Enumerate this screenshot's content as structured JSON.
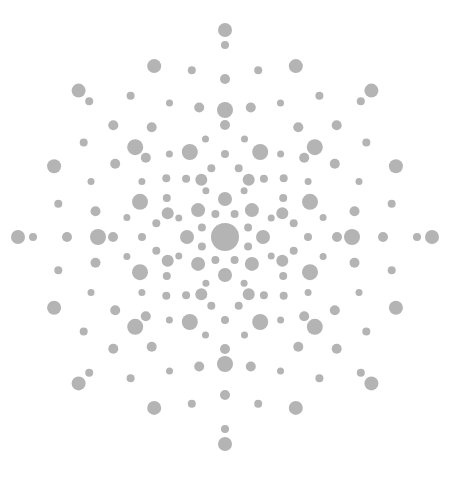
{
  "pattern": {
    "background": "#ffffff",
    "dot_color": "#b4b4b4",
    "center": [
      225,
      237
    ],
    "center_radius": 14,
    "rings": [
      {
        "r": 25,
        "count": 8,
        "size": 4,
        "offset": 22.5
      },
      {
        "r": 38,
        "count": 8,
        "size": 7,
        "offset": 0
      },
      {
        "r": 50,
        "count": 8,
        "size": 3.5,
        "offset": 22.5
      },
      {
        "r": 62,
        "count": 8,
        "size": 6,
        "offset": 22.5
      },
      {
        "r": 70,
        "count": 16,
        "size": 4,
        "offset": 11.25
      },
      {
        "r": 83,
        "count": 8,
        "size": 4,
        "offset": 0
      },
      {
        "r": 92,
        "count": 8,
        "size": 8,
        "offset": 22.5
      },
      {
        "r": 100,
        "count": 16,
        "size": 3.5,
        "offset": 11.25
      },
      {
        "r": 112,
        "count": 8,
        "size": 5,
        "offset": 0
      },
      {
        "r": 127,
        "count": 8,
        "size": 8,
        "offset": 0
      },
      {
        "r": 132,
        "count": 16,
        "size": 5,
        "offset": 11.25
      },
      {
        "r": 145,
        "count": 8,
        "size": 3.5,
        "offset": 22.5
      },
      {
        "r": 158,
        "count": 8,
        "size": 5,
        "offset": 0
      },
      {
        "r": 170,
        "count": 16,
        "size": 4,
        "offset": 11.25
      },
      {
        "r": 185,
        "count": 8,
        "size": 7,
        "offset": 22.5
      },
      {
        "r": 192,
        "count": 8,
        "size": 4,
        "offset": 0
      },
      {
        "r": 207,
        "count": 8,
        "size": 7,
        "offset": 0
      }
    ]
  }
}
